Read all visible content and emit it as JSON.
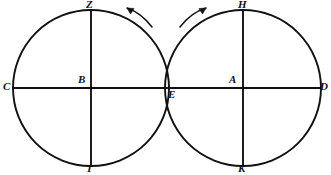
{
  "figure": {
    "type": "geometric-diagram",
    "background_color": "#ffffff",
    "stroke_color": "#111111",
    "canvas": {
      "width": 331,
      "height": 175
    },
    "circles": [
      {
        "name": "left-circle",
        "center_label": "B",
        "center": {
          "x": 91,
          "y": 88
        },
        "radius": 78,
        "top_label": "Z",
        "bottom_label": "T",
        "outer_label": "C"
      },
      {
        "name": "right-circle",
        "center_label": "A",
        "center": {
          "x": 243,
          "y": 88
        },
        "radius": 78,
        "top_label": "H",
        "bottom_label": "K",
        "outer_label": "D"
      }
    ],
    "tangent_point": {
      "label": "E",
      "x": 167,
      "y": 88
    },
    "labels": {
      "C": "C",
      "B": "B",
      "Z": "Z",
      "T": "T",
      "E": "E",
      "A": "A",
      "H": "H",
      "K": "K",
      "D": "D"
    },
    "arrows": [
      {
        "name": "left-rotation-arrow",
        "direction": "counterclockwise",
        "points_to": "left"
      },
      {
        "name": "right-rotation-arrow",
        "direction": "clockwise",
        "points_to": "right"
      }
    ]
  }
}
